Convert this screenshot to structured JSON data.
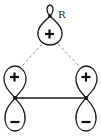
{
  "diagram": {
    "type": "orbital-overlap",
    "substituent_label": "R",
    "orbitals": [
      {
        "id": "top",
        "lobes": [
          {
            "sign": "+"
          }
        ],
        "bonded_to": "R"
      },
      {
        "id": "left",
        "lobes": [
          {
            "sign": "+"
          },
          {
            "sign": "−"
          }
        ]
      },
      {
        "id": "right",
        "lobes": [
          {
            "sign": "+"
          },
          {
            "sign": "−"
          }
        ]
      }
    ],
    "connections": [
      {
        "from": "top",
        "to": "left",
        "style": "dashed"
      },
      {
        "from": "top",
        "to": "right",
        "style": "dashed"
      },
      {
        "from": "left",
        "to": "right",
        "style": "solid"
      }
    ],
    "colors": {
      "stroke": "#1a1a1a",
      "bond": "#555555",
      "dashed": "#8a8a8a",
      "background": "#ffffff"
    }
  }
}
